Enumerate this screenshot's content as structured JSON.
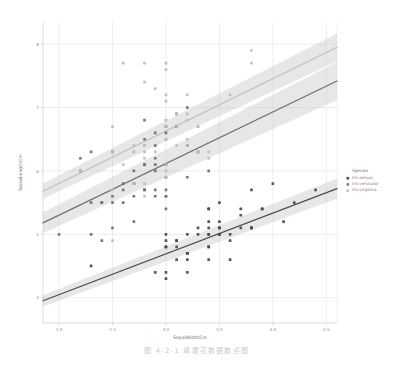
{
  "caption": "图 4-2-1   鸢尾花数据散点图",
  "legend": {
    "title": "Species",
    "items": [
      {
        "label": "Iris-setosa",
        "color": "#4a4a4a",
        "marker": "square"
      },
      {
        "label": "Iris-versicolor",
        "color": "#7d7d7d",
        "marker": "square"
      },
      {
        "label": "Iris-virginica",
        "color": "#c4c4c4",
        "marker": "square"
      }
    ]
  },
  "chart_data": {
    "type": "scatter",
    "title": "",
    "xlabel": "SepalWidthCm",
    "ylabel": "SepalLengthCm",
    "xlim": [
      1.85,
      4.6
    ],
    "ylim": [
      3.6,
      8.35
    ],
    "xticks": [
      "2.0",
      "2.5",
      "3.0",
      "3.5",
      "4.0",
      "4.5"
    ],
    "xtick_values": [
      2.0,
      2.5,
      3.0,
      3.5,
      4.0,
      4.5
    ],
    "yticks": [
      "4",
      "5",
      "6",
      "7",
      "8"
    ],
    "ytick_values": [
      4,
      5,
      6,
      7,
      8
    ],
    "grid": true,
    "legend_position": "right",
    "regression": true,
    "confidence_band": true,
    "series": [
      {
        "name": "Iris-setosa",
        "color": "#4a4a4a",
        "fit": {
          "x0": 1.85,
          "y0": 3.95,
          "x1": 4.6,
          "y1": 5.72,
          "band": 0.16
        },
        "points": [
          [
            3.5,
            5.1
          ],
          [
            3.0,
            4.9
          ],
          [
            3.2,
            4.7
          ],
          [
            3.1,
            4.6
          ],
          [
            3.6,
            5.0
          ],
          [
            3.9,
            5.4
          ],
          [
            3.4,
            4.6
          ],
          [
            3.4,
            5.0
          ],
          [
            2.9,
            4.4
          ],
          [
            3.1,
            4.9
          ],
          [
            3.7,
            5.4
          ],
          [
            3.4,
            4.8
          ],
          [
            3.0,
            4.8
          ],
          [
            3.0,
            4.3
          ],
          [
            4.0,
            5.8
          ],
          [
            4.4,
            5.7
          ],
          [
            3.9,
            5.4
          ],
          [
            3.5,
            5.1
          ],
          [
            3.8,
            5.7
          ],
          [
            3.8,
            5.1
          ],
          [
            3.4,
            5.4
          ],
          [
            3.7,
            5.1
          ],
          [
            3.6,
            4.6
          ],
          [
            3.3,
            5.1
          ],
          [
            3.4,
            4.8
          ],
          [
            3.0,
            5.0
          ],
          [
            3.4,
            5.0
          ],
          [
            3.5,
            5.2
          ],
          [
            3.4,
            5.2
          ],
          [
            3.2,
            4.7
          ],
          [
            3.1,
            4.8
          ],
          [
            3.4,
            5.4
          ],
          [
            4.1,
            5.2
          ],
          [
            4.2,
            5.5
          ],
          [
            3.1,
            4.9
          ],
          [
            3.2,
            5.0
          ],
          [
            3.5,
            5.5
          ],
          [
            3.6,
            4.9
          ],
          [
            3.0,
            4.4
          ],
          [
            3.4,
            5.1
          ],
          [
            3.5,
            5.0
          ],
          [
            2.3,
            4.5
          ],
          [
            3.2,
            4.4
          ],
          [
            3.5,
            5.0
          ],
          [
            3.8,
            5.1
          ],
          [
            3.0,
            4.8
          ],
          [
            3.8,
            5.1
          ],
          [
            3.2,
            4.6
          ],
          [
            3.7,
            5.3
          ],
          [
            3.3,
            5.0
          ]
        ]
      },
      {
        "name": "Iris-versicolor",
        "color": "#6f6f6f",
        "fit": {
          "x0": 1.85,
          "y0": 5.18,
          "x1": 4.6,
          "y1": 7.42,
          "band": 0.3
        },
        "points": [
          [
            3.2,
            7.0
          ],
          [
            3.2,
            6.4
          ],
          [
            3.1,
            6.9
          ],
          [
            2.3,
            5.5
          ],
          [
            2.8,
            6.5
          ],
          [
            2.8,
            5.7
          ],
          [
            3.3,
            6.3
          ],
          [
            2.4,
            4.9
          ],
          [
            2.9,
            6.6
          ],
          [
            2.7,
            5.2
          ],
          [
            2.0,
            5.0
          ],
          [
            3.0,
            5.9
          ],
          [
            2.2,
            6.0
          ],
          [
            2.9,
            6.1
          ],
          [
            2.9,
            5.6
          ],
          [
            3.1,
            6.7
          ],
          [
            3.0,
            5.6
          ],
          [
            2.7,
            5.8
          ],
          [
            2.2,
            6.2
          ],
          [
            2.5,
            5.6
          ],
          [
            3.2,
            5.9
          ],
          [
            2.8,
            6.1
          ],
          [
            2.5,
            6.3
          ],
          [
            2.8,
            6.1
          ],
          [
            2.9,
            6.4
          ],
          [
            3.0,
            6.6
          ],
          [
            2.8,
            6.8
          ],
          [
            3.0,
            6.7
          ],
          [
            2.9,
            6.0
          ],
          [
            2.6,
            5.7
          ],
          [
            2.4,
            5.5
          ],
          [
            2.4,
            5.5
          ],
          [
            2.7,
            5.8
          ],
          [
            2.7,
            6.0
          ],
          [
            3.0,
            5.4
          ],
          [
            3.4,
            6.0
          ],
          [
            3.1,
            6.7
          ],
          [
            2.3,
            6.3
          ],
          [
            3.0,
            5.6
          ],
          [
            2.5,
            5.5
          ],
          [
            2.6,
            5.5
          ],
          [
            3.0,
            6.1
          ],
          [
            2.6,
            5.8
          ],
          [
            2.3,
            5.0
          ],
          [
            2.7,
            5.6
          ],
          [
            3.0,
            5.7
          ],
          [
            2.9,
            5.7
          ],
          [
            2.9,
            6.2
          ],
          [
            2.5,
            5.1
          ],
          [
            2.8,
            5.7
          ]
        ]
      },
      {
        "name": "Iris-virginica",
        "color": "#bdbdbd",
        "fit": {
          "x0": 1.85,
          "y0": 5.68,
          "x1": 4.6,
          "y1": 7.95,
          "band": 0.22
        },
        "points": [
          [
            3.3,
            6.3
          ],
          [
            2.7,
            5.8
          ],
          [
            3.0,
            7.1
          ],
          [
            2.9,
            6.3
          ],
          [
            3.0,
            6.5
          ],
          [
            3.0,
            7.6
          ],
          [
            2.5,
            4.9
          ],
          [
            2.9,
            7.3
          ],
          [
            2.5,
            6.7
          ],
          [
            3.6,
            7.2
          ],
          [
            3.2,
            6.5
          ],
          [
            2.7,
            6.4
          ],
          [
            3.0,
            6.8
          ],
          [
            2.5,
            5.7
          ],
          [
            2.8,
            5.8
          ],
          [
            3.2,
            6.4
          ],
          [
            3.0,
            6.5
          ],
          [
            3.8,
            7.7
          ],
          [
            2.6,
            7.7
          ],
          [
            2.2,
            6.0
          ],
          [
            3.2,
            6.9
          ],
          [
            2.8,
            5.6
          ],
          [
            2.8,
            7.7
          ],
          [
            2.7,
            6.3
          ],
          [
            3.3,
            6.7
          ],
          [
            3.2,
            7.2
          ],
          [
            2.8,
            6.2
          ],
          [
            3.0,
            6.1
          ],
          [
            2.8,
            6.4
          ],
          [
            3.0,
            7.2
          ],
          [
            2.8,
            7.4
          ],
          [
            3.8,
            7.9
          ],
          [
            2.8,
            6.4
          ],
          [
            2.8,
            6.3
          ],
          [
            2.6,
            6.1
          ],
          [
            3.0,
            7.7
          ],
          [
            3.4,
            6.3
          ],
          [
            3.1,
            6.4
          ],
          [
            3.0,
            6.0
          ],
          [
            3.1,
            6.9
          ],
          [
            3.1,
            6.7
          ],
          [
            3.1,
            6.9
          ],
          [
            2.7,
            5.8
          ],
          [
            3.2,
            6.8
          ],
          [
            3.3,
            6.7
          ],
          [
            3.0,
            6.7
          ],
          [
            2.5,
            6.3
          ],
          [
            3.0,
            6.5
          ],
          [
            3.4,
            6.2
          ],
          [
            3.0,
            5.9
          ]
        ]
      }
    ]
  }
}
